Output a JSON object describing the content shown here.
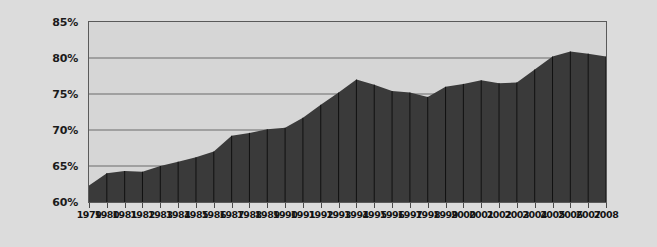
{
  "chart_data": {
    "type": "area",
    "title": "",
    "subtitle": "",
    "xlabel": "",
    "ylabel": "",
    "grid": true,
    "legend": null,
    "xlim": [
      1979,
      2008
    ],
    "ylim": [
      60,
      85
    ],
    "y_ticks": [
      "60%",
      "65%",
      "70%",
      "75%",
      "80%",
      "85%"
    ],
    "y_tick_values": [
      60,
      65,
      70,
      75,
      80,
      85
    ],
    "categories": [
      "1979",
      "1980",
      "1981",
      "1982",
      "1983",
      "1984",
      "1985",
      "1986",
      "1987",
      "1988",
      "1989",
      "1990",
      "1991",
      "1992",
      "1993",
      "1994",
      "1995",
      "1996",
      "1997",
      "1998",
      "1999",
      "2000",
      "2001",
      "2002",
      "2003",
      "2004",
      "2005",
      "2006",
      "2007",
      "2008"
    ],
    "values": [
      62.3,
      64.0,
      64.3,
      64.2,
      65.0,
      65.6,
      66.2,
      67.0,
      69.2,
      69.6,
      70.1,
      70.3,
      71.7,
      73.5,
      75.2,
      77.0,
      76.3,
      75.4,
      75.2,
      74.6,
      76.0,
      76.4,
      76.9,
      76.5,
      76.6,
      78.4,
      80.2,
      80.9,
      80.6,
      80.2
    ],
    "series": [
      {
        "name": "value",
        "values": [
          62.3,
          64.0,
          64.3,
          64.2,
          65.0,
          65.6,
          66.2,
          67.0,
          69.2,
          69.6,
          70.1,
          70.3,
          71.7,
          73.5,
          75.2,
          77.0,
          76.3,
          75.4,
          75.2,
          74.6,
          76.0,
          76.4,
          76.9,
          76.5,
          76.6,
          78.4,
          80.2,
          80.9,
          80.6,
          80.2
        ]
      }
    ]
  },
  "colors": {
    "page_background": "#dcdcdc",
    "plot_background": "#d6d6d6",
    "area_fill": "#3a3a3a",
    "gridline": "#6a6a6a",
    "separator": "#111111",
    "border": "#5a5a5a",
    "axis_text": "#141414"
  }
}
